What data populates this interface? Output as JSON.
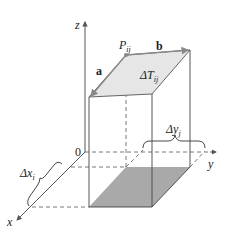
{
  "diagram": {
    "axes": {
      "x_label": "x",
      "y_label": "y",
      "z_label": "z",
      "origin_label": "0"
    },
    "point": {
      "label": "P",
      "subscript": "ij"
    },
    "vectors": {
      "a": "a",
      "b": "b"
    },
    "patch": {
      "label": "ΔT",
      "subscript": "ij"
    },
    "delta_x": {
      "label": "Δx",
      "subscript": "i"
    },
    "delta_y": {
      "label": "Δy",
      "subscript": "j"
    },
    "colors": {
      "line": "#444444",
      "top_fill": "#e6e6e6",
      "base_fill": "#a9a9a9",
      "vector": "#777777"
    }
  }
}
